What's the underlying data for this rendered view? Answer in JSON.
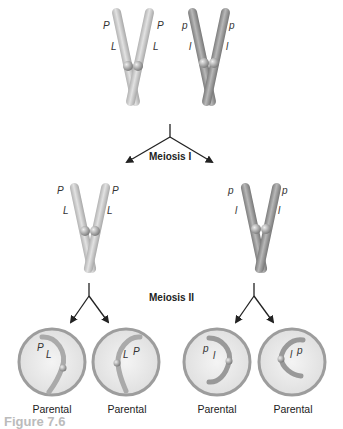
{
  "figure": {
    "type": "meiosis-diagram",
    "colors": {
      "light_chromosome": "#c9c9c9",
      "dark_chromosome": "#9a9a9a",
      "cell_border": "#9d9d9d",
      "cell_fill": "#ececec",
      "arrow": "#222222"
    },
    "top_row": {
      "chromosome_light": {
        "alleles_left": [
          "P",
          "L"
        ],
        "alleles_right": [
          "P",
          "L"
        ]
      },
      "chromosome_dark": {
        "alleles_left": [
          "p",
          "l"
        ],
        "alleles_right": [
          "p",
          "l"
        ]
      }
    },
    "stage1": {
      "label": "Meiosis I"
    },
    "middle_row": {
      "left": {
        "alleles_left": [
          "P",
          "L"
        ],
        "alleles_right": [
          "P",
          "L"
        ]
      },
      "right": {
        "alleles_left": [
          "p",
          "l"
        ],
        "alleles_right": [
          "p",
          "l"
        ]
      }
    },
    "stage2": {
      "label": "Meiosis II"
    },
    "gametes": [
      {
        "alleles": [
          "P",
          "L"
        ],
        "label": "Parental"
      },
      {
        "alleles": [
          "L",
          "P"
        ],
        "label": "Parental"
      },
      {
        "alleles": [
          "p",
          "l"
        ],
        "label": "Parental"
      },
      {
        "alleles": [
          "l",
          "p"
        ],
        "label": "Parental"
      }
    ],
    "caption": "Figure 7.6"
  }
}
